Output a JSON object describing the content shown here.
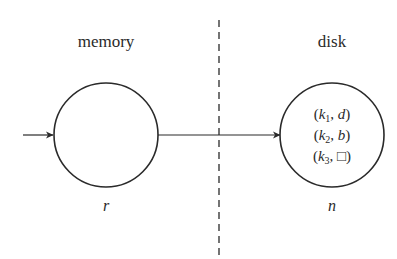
{
  "diagram": {
    "regions": {
      "left_label": "memory",
      "right_label": "disk"
    },
    "nodes": [
      {
        "id": "r",
        "label": "r",
        "region": "memory",
        "contents": []
      },
      {
        "id": "n",
        "label": "n",
        "region": "disk",
        "contents": [
          {
            "open": "(",
            "key": "k",
            "sub": "1",
            "sep": ", ",
            "value": "d",
            "close": ")"
          },
          {
            "open": "(",
            "key": "k",
            "sub": "2",
            "sep": ", ",
            "value": "b",
            "close": ")"
          },
          {
            "open": "(",
            "key": "k",
            "sub": "3",
            "sep": ", ",
            "value": "□",
            "close": ")"
          }
        ]
      }
    ],
    "edges": [
      {
        "from": "external",
        "to": "r",
        "type": "arrow"
      },
      {
        "from": "r",
        "to": "n",
        "type": "arrow"
      }
    ],
    "separator": {
      "style": "dashed",
      "meaning": "memory/disk boundary"
    },
    "colors": {
      "stroke": "#2a2a2a",
      "text": "#2a2a2a",
      "background": "#ffffff"
    }
  }
}
